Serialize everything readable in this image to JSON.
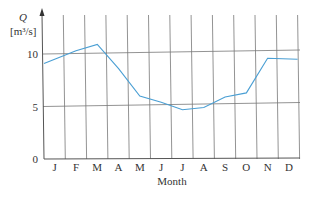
{
  "chart_data": {
    "type": "line",
    "title": "",
    "ylabel_symbol": "Q",
    "ylabel_unit": "[m³/s]",
    "xlabel": "Month",
    "categories": [
      "J",
      "F",
      "M",
      "A",
      "M",
      "J",
      "J",
      "A",
      "S",
      "O",
      "N",
      "D"
    ],
    "series": [
      {
        "name": "Q",
        "color": "#4a9fd4",
        "values": [
          9.1,
          10.3,
          10.9,
          8.6,
          6.0,
          5.4,
          4.7,
          4.9,
          5.9,
          6.3,
          9.6,
          9.5
        ]
      }
    ],
    "yticks": [
      0,
      5,
      10
    ],
    "ytick_labels": [
      "0",
      "5",
      "10"
    ],
    "ylim": [
      0,
      13
    ],
    "grid": true,
    "legend": "none"
  }
}
